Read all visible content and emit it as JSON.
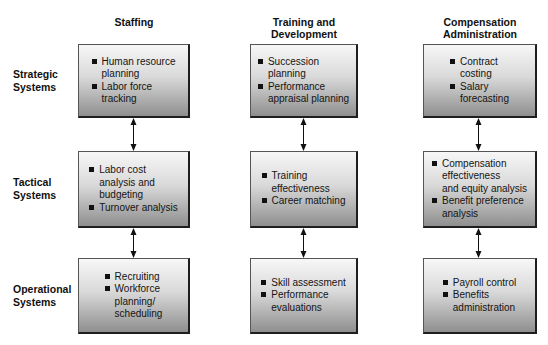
{
  "columns": [
    {
      "label": "Staffing"
    },
    {
      "label": "Training and\nDevelopment"
    },
    {
      "label": "Compensation\nAdministration"
    }
  ],
  "rows": [
    {
      "label": "Strategic\nSystems"
    },
    {
      "label": "Tactical\nSystems"
    },
    {
      "label": "Operational\nSystems"
    }
  ],
  "cells": {
    "strategic": {
      "staffing": [
        "Human resource\nplanning",
        "Labor force\ntracking"
      ],
      "training": [
        "Succession\nplanning",
        "Performance\nappraisal planning"
      ],
      "compensation": [
        "Contract\ncosting",
        "Salary\nforecasting"
      ]
    },
    "tactical": {
      "staffing": [
        "Labor cost\nanalysis and\nbudgeting",
        "Turnover analysis"
      ],
      "training": [
        "Training\neffectiveness",
        "Career matching"
      ],
      "compensation": [
        "Compensation\neffectiveness\nand equity analysis",
        "Benefit preference\nanalysis"
      ]
    },
    "operational": {
      "staffing": [
        "Recruiting",
        "Workforce\nplanning/\nscheduling"
      ],
      "training": [
        "Skill assessment",
        "Performance\nevaluations"
      ],
      "compensation": [
        "Payroll control",
        "Benefits\nadministration"
      ]
    }
  },
  "connectors": {
    "type": "bidirectional-arrow",
    "icon": "double-headed-vertical-arrow"
  }
}
